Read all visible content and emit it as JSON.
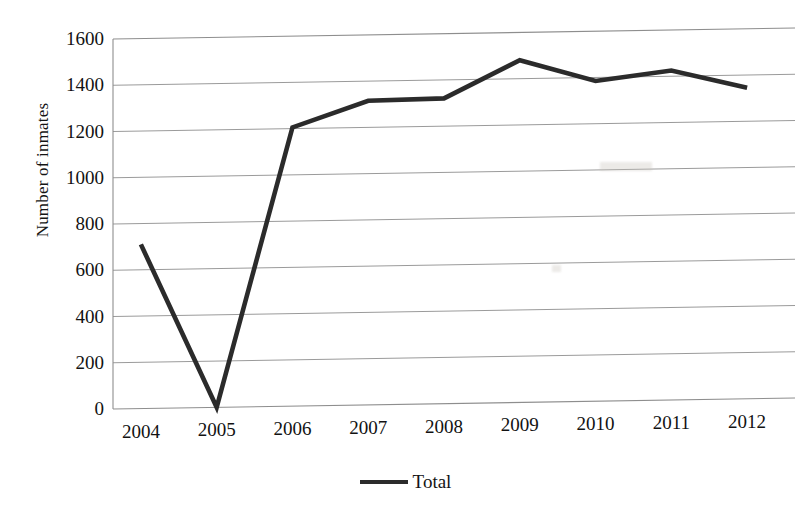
{
  "chart_data": {
    "type": "line",
    "title": "",
    "xlabel": "",
    "ylabel": "Number of inmates",
    "categories": [
      "2004",
      "2005",
      "2006",
      "2007",
      "2008",
      "2009",
      "2010",
      "2011",
      "2012"
    ],
    "series": [
      {
        "name": "Total",
        "values": [
          710,
          0,
          1205,
          1315,
          1320,
          1480,
          1385,
          1425,
          1345
        ],
        "color": "#2b2b2b"
      }
    ],
    "ylim": [
      0,
      1600
    ],
    "yticks": [
      0,
      200,
      400,
      600,
      800,
      1000,
      1200,
      1400,
      1600
    ],
    "ytick_labels": [
      "0",
      "200",
      "400",
      "600",
      "800",
      "1000",
      "1200",
      "1400",
      "1600"
    ],
    "grid": true,
    "grid_axis": "y",
    "legend": {
      "position": "bottom",
      "entries": [
        {
          "label": "Total",
          "marker": "line-swatch",
          "color": "#2b2b2b"
        }
      ]
    }
  }
}
